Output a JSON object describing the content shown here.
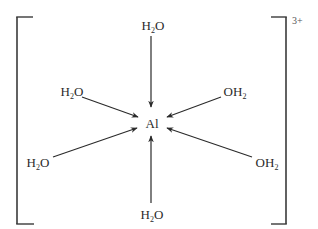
{
  "diagram": {
    "central_atom": "Al",
    "charge": "3+",
    "colors": {
      "line": "#2a2a2a",
      "text": "#2a2a2a",
      "background": "#ffffff"
    },
    "ligands": [
      {
        "id": "top",
        "main": "H",
        "sub": "2",
        "tail": "O",
        "format": "H2O"
      },
      {
        "id": "upper-left",
        "main": "H",
        "sub": "2",
        "tail": "O",
        "format": "H2O"
      },
      {
        "id": "upper-right",
        "main": "OH",
        "sub": "2",
        "tail": "",
        "format": "OH2"
      },
      {
        "id": "lower-left",
        "main": "H",
        "sub": "2",
        "tail": "O",
        "format": "H2O"
      },
      {
        "id": "lower-right",
        "main": "OH",
        "sub": "2",
        "tail": "",
        "format": "OH2"
      },
      {
        "id": "bottom",
        "main": "H",
        "sub": "2",
        "tail": "O",
        "format": "H2O"
      }
    ],
    "bonds": [
      {
        "from": "top",
        "to": "Al",
        "type": "dative-arrow"
      },
      {
        "from": "upper-left",
        "to": "Al",
        "type": "dative-arrow"
      },
      {
        "from": "upper-right",
        "to": "Al",
        "type": "dative-arrow"
      },
      {
        "from": "lower-left",
        "to": "Al",
        "type": "dative-arrow"
      },
      {
        "from": "lower-right",
        "to": "Al",
        "type": "dative-arrow"
      },
      {
        "from": "bottom",
        "to": "Al",
        "type": "dative-arrow"
      }
    ]
  }
}
